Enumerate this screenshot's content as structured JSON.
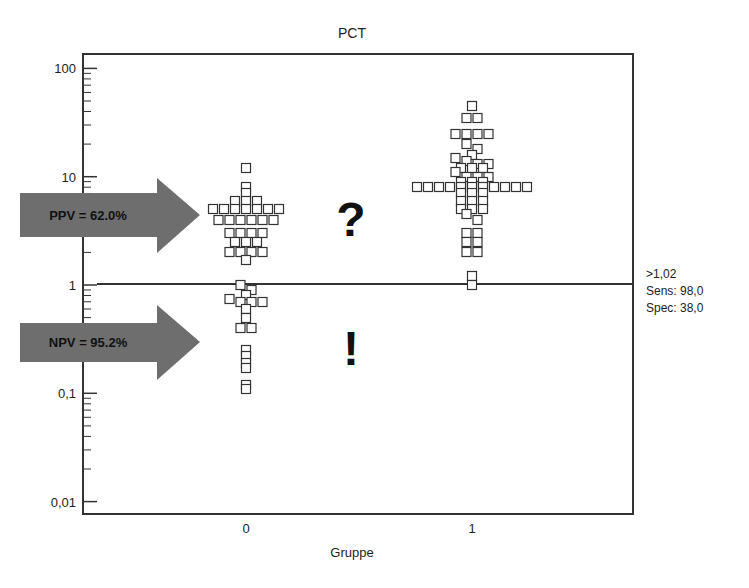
{
  "chart_data": {
    "type": "scatter",
    "title": "PCT",
    "xlabel": "Gruppe",
    "ylabel": "",
    "yscale": "log",
    "ylim": [
      0.008,
      150
    ],
    "y_ticks": [
      {
        "value": 100,
        "label": "100"
      },
      {
        "value": 10,
        "label": "10"
      },
      {
        "value": 1,
        "label": "1"
      },
      {
        "value": 0.1,
        "label": "0,1"
      },
      {
        "value": 0.01,
        "label": "0,01"
      }
    ],
    "x_ticks": [
      {
        "value": 0,
        "label": "0"
      },
      {
        "value": 1,
        "label": "1"
      }
    ],
    "grid": false,
    "marker": "open-square",
    "cutoff_line": {
      "value": 1.02,
      "label": ">1,02",
      "sens_label": "Sens: 98,0",
      "spec_label": "Spec: 38,0"
    },
    "series": [
      {
        "name": "Gruppe 0",
        "x": 0,
        "values": [
          12,
          8,
          7,
          6,
          6,
          6,
          5,
          5,
          5,
          5,
          5,
          5,
          5,
          4,
          4,
          4,
          4,
          4,
          4,
          3,
          3,
          3,
          3,
          2.5,
          2.5,
          2.5,
          2,
          2,
          2,
          2,
          1.7,
          1.0,
          0.9,
          0.8,
          0.75,
          0.7,
          0.7,
          0.7,
          0.6,
          0.5,
          0.4,
          0.4,
          0.25,
          0.22,
          0.19,
          0.17,
          0.12,
          0.11
        ]
      },
      {
        "name": "Gruppe 1",
        "x": 1,
        "values": [
          45,
          35,
          35,
          25,
          25,
          25,
          25,
          20,
          18,
          16,
          15,
          14,
          13,
          13,
          12,
          12,
          12,
          11,
          10,
          10,
          10,
          9,
          9,
          9,
          8,
          8,
          8,
          8,
          8,
          8,
          8,
          8,
          8,
          8,
          8,
          7,
          7,
          7,
          6,
          6,
          6,
          5,
          5,
          5,
          4.5,
          4,
          3,
          3,
          2.5,
          2.5,
          2,
          2,
          1.2,
          1.0
        ]
      }
    ],
    "annotations": [
      {
        "type": "arrow",
        "text": "PPV = 62.0%",
        "region": "above cutoff"
      },
      {
        "type": "arrow",
        "text": "NPV = 95.2%",
        "region": "below cutoff"
      },
      {
        "type": "text",
        "text": "?",
        "region": "above cutoff"
      },
      {
        "type": "text",
        "text": "!",
        "region": "below cutoff"
      }
    ]
  },
  "title": "PCT",
  "xlabel": "Gruppe",
  "ppv_label": "PPV = 62.0%",
  "npv_label": "NPV = 95.2%",
  "question_mark": "?",
  "exclamation_mark": "!",
  "cutoff": {
    "label": ">1,02",
    "sens": "Sens: 98,0",
    "spec": "Spec: 38,0"
  },
  "colors": {
    "axis": "#333333",
    "arrow": "#6e6e6e",
    "marker_stroke": "#333333",
    "text": "#222222"
  }
}
